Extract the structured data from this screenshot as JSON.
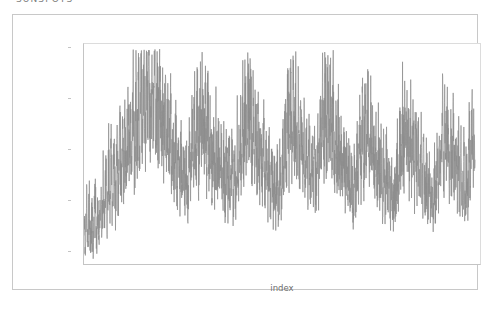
{
  "title": "SUNSPOTS",
  "axis": {
    "xlabel": "index",
    "ylabel": ""
  },
  "chart_data": {
    "type": "line",
    "title": "SUNSPOTS",
    "xlabel": "index",
    "ylabel": "",
    "xlim": [
      1973.0,
      2022.5
    ],
    "ylim": [
      0,
      87
    ],
    "grid": false,
    "legend": null,
    "xticks": [
      1980,
      1990,
      2000,
      2010,
      2020
    ],
    "yticks": [
      0,
      20,
      40,
      60,
      80
    ],
    "line_color": "#8d8d8d",
    "line_width": 0.7,
    "series": [
      {
        "name": "sunspots",
        "x_start": 1973.0,
        "x_step": 0.0833,
        "values": [
          18,
          12,
          9,
          17,
          22,
          14,
          8,
          19,
          25,
          13,
          7,
          16,
          20,
          11,
          6,
          14,
          24,
          30,
          12,
          9,
          18,
          27,
          15,
          10,
          21,
          33,
          19,
          12,
          26,
          35,
          22,
          14,
          29,
          38,
          24,
          16,
          31,
          41,
          27,
          18,
          34,
          44,
          29,
          21,
          37,
          47,
          32,
          23,
          28,
          39,
          48,
          33,
          26,
          41,
          52,
          36,
          28,
          44,
          55,
          38,
          31,
          46,
          57,
          41,
          33,
          48,
          60,
          43,
          35,
          51,
          63,
          45,
          38,
          54,
          66,
          48,
          40,
          57,
          69,
          51,
          43,
          60,
          72,
          54,
          46,
          63,
          75,
          57,
          49,
          66,
          78,
          60,
          52,
          69,
          80,
          62,
          55,
          71,
          79,
          64,
          57,
          73,
          77,
          66,
          59,
          70,
          74,
          62,
          56,
          67,
          71,
          59,
          52,
          64,
          68,
          56,
          49,
          61,
          65,
          53,
          46,
          58,
          62,
          50,
          43,
          55,
          59,
          47,
          40,
          52,
          56,
          44,
          37,
          49,
          53,
          41,
          34,
          46,
          50,
          38,
          31,
          43,
          47,
          35,
          29,
          40,
          44,
          33,
          27,
          38,
          42,
          31,
          25,
          36,
          40,
          29,
          24,
          34,
          47,
          38,
          29,
          41,
          55,
          44,
          33,
          48,
          62,
          49,
          37,
          53,
          66,
          52,
          40,
          57,
          70,
          55,
          43,
          60,
          68,
          53,
          41,
          57,
          64,
          50,
          38,
          53,
          60,
          47,
          36,
          50,
          57,
          44,
          34,
          47,
          54,
          42,
          32,
          45,
          51,
          40,
          30,
          42,
          48,
          37,
          28,
          40,
          46,
          35,
          27,
          38,
          44,
          34,
          26,
          37,
          43,
          33,
          25,
          36,
          42,
          32,
          24,
          35,
          41,
          31,
          23,
          34,
          40,
          30,
          29,
          41,
          52,
          43,
          33,
          47,
          60,
          50,
          38,
          54,
          66,
          54,
          42,
          58,
          70,
          57,
          45,
          61,
          72,
          59,
          47,
          63,
          69,
          55,
          43,
          58,
          65,
          51,
          39,
          54,
          61,
          47,
          36,
          50,
          57,
          44,
          33,
          46,
          53,
          41,
          31,
          43,
          49,
          38,
          29,
          40,
          46,
          35,
          27,
          37,
          43,
          33,
          25,
          35,
          41,
          31,
          23,
          33,
          39,
          29,
          22,
          32,
          38,
          28,
          21,
          31,
          37,
          27,
          28,
          38,
          48,
          40,
          31,
          44,
          57,
          48,
          37,
          52,
          65,
          54,
          42,
          58,
          70,
          57,
          45,
          60,
          71,
          58,
          46,
          61,
          67,
          53,
          42,
          56,
          63,
          49,
          38,
          52,
          59,
          46,
          35,
          48,
          55,
          43,
          33,
          45,
          51,
          40,
          30,
          42,
          48,
          37,
          28,
          39,
          45,
          35,
          27,
          37,
          43,
          33,
          30,
          41,
          54,
          45,
          35,
          49,
          62,
          52,
          40,
          56,
          68,
          56,
          44,
          59,
          71,
          58,
          46,
          61,
          70,
          57,
          45,
          59,
          66,
          52,
          41,
          55,
          62,
          48,
          37,
          51,
          58,
          45,
          34,
          47,
          54,
          42,
          32,
          44,
          50,
          39,
          30,
          41,
          47,
          36,
          28,
          38,
          44,
          34,
          26,
          36,
          42,
          32,
          25,
          34,
          40,
          30,
          23,
          32,
          38,
          28,
          26,
          36,
          46,
          38,
          29,
          42,
          54,
          45,
          35,
          49,
          61,
          50,
          39,
          53,
          64,
          53,
          41,
          55,
          63,
          51,
          40,
          53,
          60,
          47,
          36,
          49,
          56,
          43,
          33,
          45,
          52,
          40,
          31,
          42,
          48,
          37,
          28,
          39,
          45,
          35,
          27,
          37,
          43,
          33,
          25,
          35,
          41,
          31,
          24,
          33,
          39,
          29,
          22,
          31,
          37,
          27,
          21,
          30,
          36,
          26,
          25,
          35,
          45,
          37,
          28,
          41,
          53,
          44,
          34,
          48,
          60,
          49,
          38,
          52,
          63,
          52,
          40,
          54,
          62,
          50,
          39,
          52,
          59,
          46,
          35,
          48,
          55,
          42,
          32,
          44,
          51,
          39,
          30,
          41,
          47,
          36,
          27,
          38,
          44,
          34,
          26,
          36,
          42,
          32,
          24,
          34,
          40,
          30,
          23,
          32,
          38,
          28,
          21,
          30,
          36,
          26,
          20,
          29,
          35,
          25,
          24,
          34,
          44,
          36,
          27,
          40,
          52,
          43,
          33,
          47,
          58,
          48,
          37,
          51,
          61,
          50,
          39,
          52,
          59,
          47,
          36,
          49,
          56,
          44,
          33,
          45,
          52,
          40,
          31,
          42,
          48,
          37,
          28,
          39,
          45,
          35,
          27,
          37,
          43,
          33,
          25,
          35,
          41,
          31,
          24,
          33,
          39,
          29,
          30,
          40,
          50,
          42,
          33,
          46,
          56,
          47,
          37,
          50,
          58,
          46
        ]
      }
    ]
  }
}
